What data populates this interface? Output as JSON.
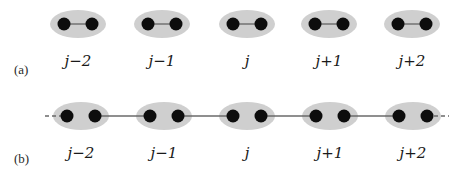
{
  "colors": {
    "ellipse_fill": "#cfcfcf",
    "atom_fill": "#0d0d0d",
    "bond_stroke": "#6a6a6a",
    "text": "#1a1a1a"
  },
  "panels": [
    {
      "id": "a",
      "label": "(a)",
      "description": "Isolated dimers: each site's two atoms bonded only within the ellipse",
      "intra_bond": true,
      "inter_bond": false,
      "sites": [
        {
          "label": "j−2",
          "cx": 78,
          "cy": 24
        },
        {
          "label": "j−1",
          "cx": 162,
          "cy": 24
        },
        {
          "label": "j",
          "cx": 247,
          "cy": 24
        },
        {
          "label": "j+1",
          "cx": 329,
          "cy": 24
        },
        {
          "label": "j+2",
          "cx": 412,
          "cy": 24
        }
      ],
      "label_y": 66,
      "panel_label_x": 14,
      "panel_label_y": 74
    },
    {
      "id": "b",
      "label": "(b)",
      "description": "Chain: bonds link neighboring sites, dashed continuation at ends",
      "intra_bond": false,
      "inter_bond": true,
      "dashed_ends": true,
      "sites": [
        {
          "label": "j−2",
          "cx": 81,
          "cy": 116
        },
        {
          "label": "j−1",
          "cx": 164,
          "cy": 116
        },
        {
          "label": "j",
          "cx": 247,
          "cy": 116
        },
        {
          "label": "j+1",
          "cx": 330,
          "cy": 116
        },
        {
          "label": "j+2",
          "cx": 413,
          "cy": 116
        }
      ],
      "label_y": 158,
      "panel_label_x": 14,
      "panel_label_y": 163
    }
  ]
}
